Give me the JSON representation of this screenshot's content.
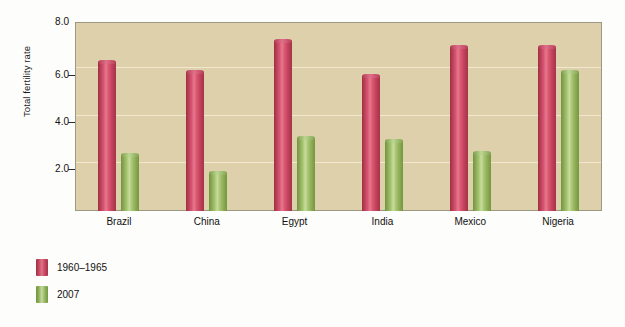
{
  "chart_data": {
    "type": "bar",
    "title": "",
    "xlabel": "",
    "ylabel": "Total fertility rate",
    "ylim": [
      0,
      8.0
    ],
    "grid": true,
    "legend_position": "bottom-left",
    "categories": [
      "Brazil",
      "China",
      "Egypt",
      "India",
      "Mexico",
      "Nigeria"
    ],
    "ytick_labels": [
      "8.0",
      "6.0",
      "4.0",
      "2.0"
    ],
    "ytick_values": [
      8.0,
      6.0,
      4.0,
      2.0
    ],
    "series": [
      {
        "name": "1960–1965",
        "color": "#c4455c",
        "values": [
          6.3,
          5.9,
          7.2,
          5.7,
          6.95,
          6.95
        ]
      },
      {
        "name": "2007",
        "color": "#8fb257",
        "values": [
          2.35,
          1.6,
          3.1,
          2.95,
          2.45,
          5.9
        ]
      }
    ],
    "plot_background": "#ddd0ab",
    "gridline_color": "#f1e8cf"
  },
  "legend": {
    "items": [
      {
        "label": "1960–1965",
        "swatch": "red"
      },
      {
        "label": "2007",
        "swatch": "green"
      }
    ]
  }
}
